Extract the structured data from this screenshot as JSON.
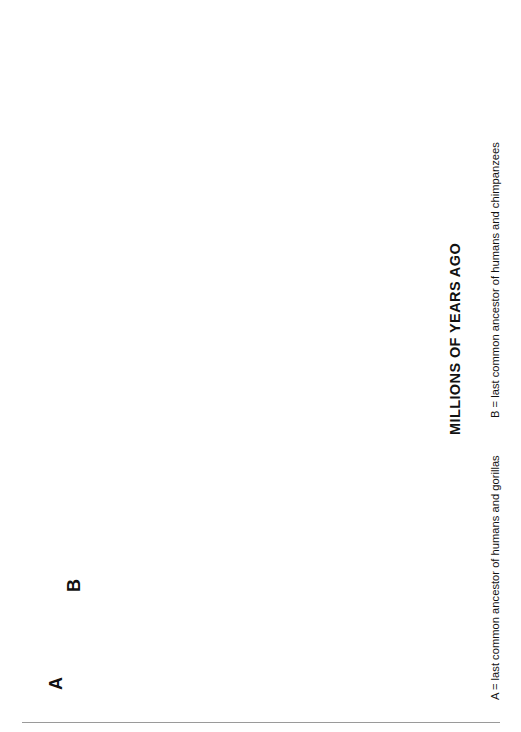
{
  "figure": {
    "axis_title": "MILLIONS OF YEARS AGO",
    "legend_a": "A = last common ancestor of humans and gorillas",
    "legend_b": "B = last common ancestor of humans and chimpanzees",
    "node_a_label": "A",
    "node_b_label": "B",
    "axis_ticks": [
      "0",
      "1",
      "2",
      "3",
      "4",
      "5",
      "6",
      "7",
      "8"
    ],
    "colors": {
      "line": "#111111",
      "gridline": "#d9d9d9",
      "silhouette": "#5c5c5c",
      "tick": "#8a8a8a",
      "background": "#ffffff"
    }
  },
  "chart_data": {
    "type": "tree",
    "title": "",
    "xlabel": "MILLIONS OF YEARS AGO",
    "ylabel": "",
    "axis_range": [
      0,
      8
    ],
    "axis_direction": "present at 0 (top), past increasing downward",
    "grid": true,
    "tips": [
      {
        "name": "Gorilla gorilla",
        "age": 0.0,
        "x": 38
      },
      {
        "name": "Pan troglodytes",
        "sub": "(chimpanzee)",
        "age": 0.0,
        "x": 61
      },
      {
        "name": "Ardipithecus ramidus",
        "age": 4.4,
        "x": 84
      },
      {
        "name": "Australopithecus anamensis",
        "age": 3.9,
        "x": 107
      },
      {
        "name": "Australopithecus afarensis",
        "age": 3.0,
        "x": 130
      },
      {
        "name": "Paranthropus aethiopicus",
        "age": 2.3,
        "x": 153
      },
      {
        "name": "Paranthropus boisei",
        "age": 1.3,
        "x": 176
      },
      {
        "name": "Paranthropus robustus",
        "age": 1.2,
        "x": 190
      },
      {
        "name": "Australopithecus africanus",
        "age": 2.2,
        "x": 204
      },
      {
        "name": "Australopithecus garhi",
        "age": 2.5,
        "x": 218
      },
      {
        "name": "Homo floresiensis",
        "age": 0.0,
        "x": 234
      },
      {
        "name": "Australopithecus sediba",
        "age": 1.9,
        "x": 257
      },
      {
        "name": "Homo habilis",
        "age": 1.5,
        "x": 272
      },
      {
        "name": "Homo rudolfensis",
        "age": 1.8,
        "x": 287
      },
      {
        "name": "Homo erectus (African)",
        "age": 0.0,
        "x": 309
      },
      {
        "name": "Homo erectus (Georgian)",
        "age": 1.75,
        "x": 324
      },
      {
        "name": "Homo heidelbergensis",
        "age": 0.35,
        "x": 340
      },
      {
        "name": "Homo erectus",
        "sub": "(Asian)",
        "age": 0.0,
        "x": 357
      },
      {
        "name": "Homo antecessor",
        "age": 0.75,
        "x": 366
      },
      {
        "name": "Homo sapiens",
        "age": 0.0,
        "x": 375
      },
      {
        "name": "Homo neanderthalensis",
        "age": 0.03,
        "x": 389
      }
    ],
    "internal_nodes": [
      {
        "id": "A",
        "age": 8.0,
        "label": "A = last common ancestor of humans and gorillas"
      },
      {
        "id": "B",
        "age": 7.0,
        "label": "B = last common ancestor of humans and chimpanzees"
      },
      {
        "id": "sahelanthropus",
        "age": 5.0,
        "name": "Sahelanthropus tchadensis"
      },
      {
        "id": "ardipithecus-australopithecus",
        "age": 4.6
      },
      {
        "id": "australopith-clade",
        "age": 4.1
      },
      {
        "id": "paranthropus",
        "age": 2.6
      },
      {
        "id": "paranthropus-boisei-robustus",
        "age": 1.9
      },
      {
        "id": "homo-clade",
        "age": 2.6
      },
      {
        "id": "homo-erectus-split",
        "age": 2.1
      },
      {
        "id": "heidelbergensis-clade",
        "age": 1.6
      },
      {
        "id": "sapiens-neanderthal",
        "age": 0.45
      }
    ],
    "extra_labels": [
      {
        "name": "Sahelanthropus tchadensis",
        "age": 6.0
      }
    ]
  }
}
